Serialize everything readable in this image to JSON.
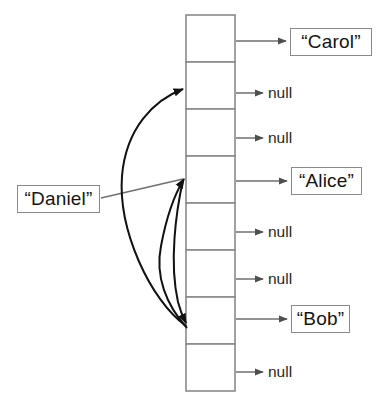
{
  "diagram": {
    "type": "hash-table-collision-chaining",
    "canvas": {
      "width": 379,
      "height": 409,
      "background": "#ffffff"
    },
    "colors": {
      "cell_stroke": "#8a8a8a",
      "arrow_stroke": "#6f6f6f",
      "curve_stroke": "#111111",
      "box_stroke": "#8a8a8a",
      "text": "#141414",
      "background": "#ffffff"
    },
    "array": {
      "name": "bucket-array",
      "slot_count": 8,
      "x": 186,
      "y": 15,
      "cell_width": 49,
      "cell_height": 47,
      "slots": [
        {
          "index": 0,
          "target": "“Carol”",
          "is_null": false
        },
        {
          "index": 1,
          "target": "null",
          "is_null": true
        },
        {
          "index": 2,
          "target": "null",
          "is_null": true
        },
        {
          "index": 3,
          "target": "“Alice”",
          "is_null": false
        },
        {
          "index": 4,
          "target": "null",
          "is_null": true
        },
        {
          "index": 5,
          "target": "null",
          "is_null": true
        },
        {
          "index": 6,
          "target": "“Bob”",
          "is_null": false
        },
        {
          "index": 7,
          "target": "null",
          "is_null": true
        }
      ]
    },
    "value_boxes": [
      {
        "label": "“Carol”",
        "x": 290,
        "y": 28,
        "width": 82,
        "height": 28,
        "slot": 0
      },
      {
        "label": "“Alice”",
        "x": 291,
        "y": 167,
        "width": 71,
        "height": 28,
        "slot": 3
      },
      {
        "label": "“Bob”",
        "x": 291,
        "y": 305,
        "width": 59,
        "height": 28,
        "slot": 6
      }
    ],
    "null_labels": [
      {
        "label": "null",
        "x": 268,
        "y": 85,
        "slot": 1
      },
      {
        "label": "null",
        "x": 268,
        "y": 130,
        "slot": 2
      },
      {
        "label": "null",
        "x": 268,
        "y": 224,
        "slot": 4
      },
      {
        "label": "null",
        "x": 268,
        "y": 271,
        "slot": 5
      },
      {
        "label": "null",
        "x": 268,
        "y": 364,
        "slot": 7
      }
    ],
    "key_box": {
      "label": "“Daniel”",
      "x": 17,
      "y": 185,
      "width": 83,
      "height": 28
    },
    "probe_arrows": [
      {
        "name": "daniel-to-slot-3",
        "from": "key-box",
        "to_slot": 3,
        "style": "straight"
      },
      {
        "name": "probe-curve-to-slot-1",
        "from_slot": 6,
        "to_slot": 1,
        "style": "curved"
      },
      {
        "name": "probe-curve-to-slot-3",
        "from_slot": 6,
        "to_slot": 3,
        "style": "curved"
      },
      {
        "name": "probe-curve-to-slot-6",
        "from": "key-box",
        "to_slot": 6,
        "style": "curved"
      }
    ]
  }
}
